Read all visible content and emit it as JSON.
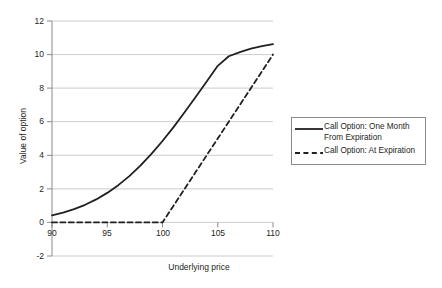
{
  "chart_data": {
    "type": "line",
    "title": "",
    "subtitle": "",
    "xlabel": "Underlying price",
    "ylabel": "Value of option",
    "xlim": [
      90,
      110
    ],
    "ylim": [
      -2,
      12
    ],
    "xticks": [
      "90",
      "95",
      "100",
      "105",
      "110"
    ],
    "yticks": [
      "12",
      "10",
      "8",
      "6",
      "4",
      "2",
      "0",
      "-2"
    ],
    "grid": "horizontal",
    "legend_position": "right-outside",
    "x": [
      90,
      91,
      92,
      93,
      94,
      95,
      96,
      97,
      98,
      99,
      100,
      101,
      102,
      103,
      104,
      105,
      106,
      107,
      108,
      109,
      110
    ],
    "series": [
      {
        "name": "Call Option: One Month From Expiration",
        "style": "solid",
        "color": "#231f20",
        "values": [
          0.42,
          0.58,
          0.79,
          1.05,
          1.37,
          1.76,
          2.22,
          2.76,
          3.38,
          4.08,
          4.85,
          5.68,
          6.56,
          7.47,
          8.4,
          9.33,
          9.9,
          10.15,
          10.35,
          10.5,
          10.62
        ]
      },
      {
        "name": "Call Option: At Expiration",
        "style": "dashed",
        "color": "#231f20",
        "values": [
          0,
          0,
          0,
          0,
          0,
          0,
          0,
          0,
          0,
          0,
          0,
          1,
          2,
          3,
          4,
          5,
          6,
          7,
          8,
          9,
          10
        ]
      }
    ]
  },
  "legend": {
    "items": [
      {
        "label": "Call Option: One Month\nFrom Expiration",
        "style": "solid"
      },
      {
        "label": "Call Option: At Expiration",
        "style": "dashed"
      }
    ]
  },
  "axes": {
    "x_title": "Underlying price",
    "y_title": "Value of option",
    "x_ticks": [
      "90",
      "95",
      "100",
      "105",
      "110"
    ],
    "y_ticks": [
      "12",
      "10",
      "8",
      "6",
      "4",
      "2",
      "0",
      "-2"
    ]
  },
  "colors": {
    "line": "#231f20",
    "grid": "#bfbfbf",
    "axis": "#8a8a8a",
    "background": "#ffffff"
  }
}
